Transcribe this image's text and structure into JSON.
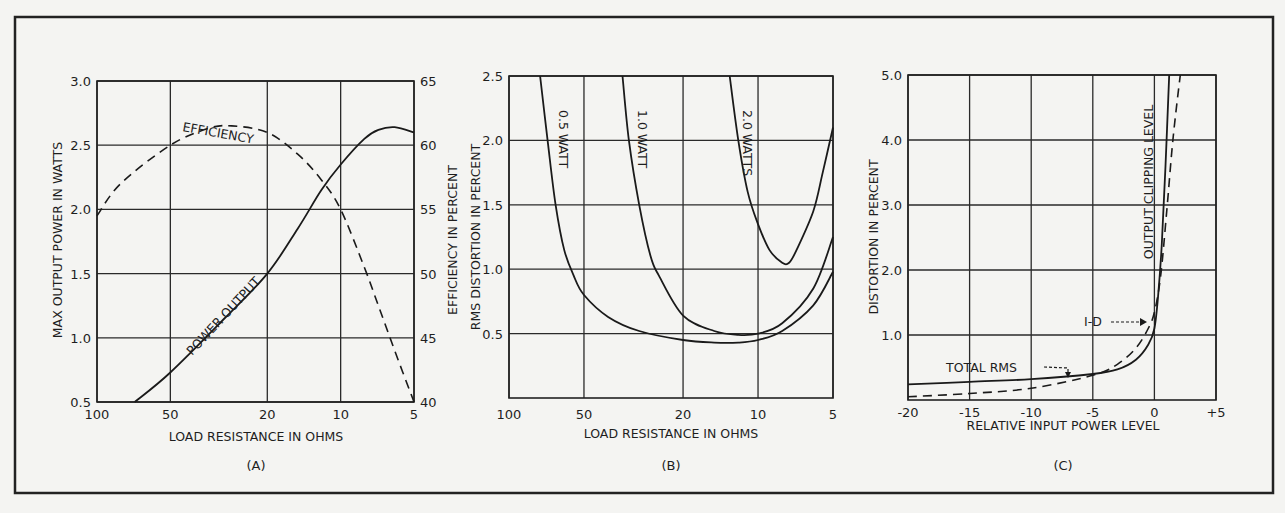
{
  "chart_data": [
    {
      "type": "line",
      "panel_label": "(A)",
      "xlabel": "LOAD RESISTANCE IN OHMS",
      "ylabel": "MAX OUTPUT POWER IN WATTS",
      "ylabel_right": "EFFICIENCY IN PERCENT",
      "xscale": "log",
      "x_reversed": true,
      "xlim": [
        100,
        5
      ],
      "ylim": [
        0.5,
        3.0
      ],
      "ylim_right": [
        40,
        65
      ],
      "x_ticks": [
        "100",
        "50",
        "20",
        "10",
        "5"
      ],
      "y_ticks": [
        "0.5",
        "1.0",
        "1.5",
        "2.0",
        "2.5",
        "3.0"
      ],
      "y_ticks_right": [
        "40",
        "45",
        "50",
        "55",
        "60",
        "65"
      ],
      "grid": true,
      "series": [
        {
          "name": "POWER OUTPUT",
          "style": "solid",
          "axis": "left",
          "x": [
            70,
            50,
            30,
            20,
            15,
            12,
            10,
            8,
            7,
            6,
            5
          ],
          "y": [
            0.5,
            0.73,
            1.15,
            1.5,
            1.85,
            2.15,
            2.35,
            2.55,
            2.62,
            2.64,
            2.6
          ]
        },
        {
          "name": "EFFICIENCY",
          "style": "dashed",
          "axis": "right",
          "x": [
            100,
            80,
            50,
            35,
            28,
            20,
            15,
            12,
            10,
            8,
            7,
            6,
            5
          ],
          "y": [
            54.5,
            57,
            60,
            61.3,
            61.5,
            61,
            59.3,
            57.3,
            55,
            50.5,
            47.5,
            44,
            40
          ]
        }
      ]
    },
    {
      "type": "line",
      "panel_label": "(B)",
      "xlabel": "LOAD RESISTANCE IN OHMS",
      "ylabel": "RMS DISTORTION IN PERCENT",
      "xscale": "log",
      "x_reversed": true,
      "xlim": [
        100,
        5
      ],
      "ylim": [
        0,
        2.5
      ],
      "x_ticks": [
        "100",
        "50",
        "20",
        "10",
        "5"
      ],
      "y_ticks": [
        "0.5",
        "1.0",
        "1.5",
        "2.0",
        "2.5"
      ],
      "grid": true,
      "series": [
        {
          "name": "0.5 WATT",
          "style": "solid",
          "x": [
            75,
            70,
            65,
            60,
            55,
            50,
            40,
            30,
            20,
            15,
            12,
            10,
            8,
            6,
            5
          ],
          "y": [
            2.5,
            2.0,
            1.5,
            1.15,
            0.95,
            0.8,
            0.63,
            0.52,
            0.45,
            0.43,
            0.43,
            0.45,
            0.52,
            0.72,
            0.98
          ]
        },
        {
          "name": "1.0 WATT",
          "style": "solid",
          "x": [
            35,
            33,
            30,
            27,
            25,
            20,
            15,
            12,
            10,
            8,
            6,
            5
          ],
          "y": [
            2.5,
            2.0,
            1.5,
            1.1,
            0.95,
            0.64,
            0.52,
            0.49,
            0.5,
            0.58,
            0.85,
            1.25
          ]
        },
        {
          "name": "2.0 WATTS",
          "style": "solid",
          "x": [
            13,
            12,
            11,
            10,
            9,
            8,
            7.5,
            7,
            6,
            5.5,
            5
          ],
          "y": [
            2.5,
            2.0,
            1.6,
            1.35,
            1.15,
            1.05,
            1.05,
            1.15,
            1.45,
            1.75,
            2.1
          ]
        }
      ]
    },
    {
      "type": "line",
      "panel_label": "(C)",
      "xlabel": "RELATIVE INPUT POWER LEVEL",
      "ylabel": "DISTORTION IN PERCENT",
      "xlim": [
        -20,
        5
      ],
      "ylim": [
        0,
        5.0
      ],
      "x_ticks": [
        "-20",
        "-15",
        "-10",
        "-5",
        "0",
        "+5"
      ],
      "y_ticks": [
        "1.0",
        "2.0",
        "3.0",
        "4.0",
        "5.0"
      ],
      "grid": true,
      "annotations": [
        "OUTPUT CLIPPING LEVEL",
        "TOTAL RMS",
        "I-D"
      ],
      "series": [
        {
          "name": "TOTAL RMS",
          "style": "solid",
          "x": [
            -20,
            -15,
            -10,
            -5,
            -3,
            -1.5,
            -0.5,
            0,
            0.3,
            0.6,
            0.9,
            1.2
          ],
          "y": [
            0.24,
            0.28,
            0.32,
            0.4,
            0.47,
            0.62,
            0.85,
            1.1,
            1.6,
            2.4,
            3.6,
            5.0
          ]
        },
        {
          "name": "I-D",
          "style": "dashed",
          "x": [
            -20,
            -15,
            -10,
            -5,
            -3,
            -1.5,
            -0.5,
            0,
            0.5,
            1.0,
            1.5,
            2.1
          ],
          "y": [
            0.05,
            0.1,
            0.18,
            0.38,
            0.55,
            0.8,
            1.1,
            1.35,
            1.9,
            2.9,
            4.0,
            5.0
          ]
        }
      ]
    }
  ],
  "panels": {
    "a": {
      "label": "(A)",
      "xlabel": "LOAD RESISTANCE IN OHMS",
      "ylabel": "MAX OUTPUT POWER IN WATTS",
      "ylabel_right": "EFFICIENCY IN PERCENT",
      "curve_power": "POWER OUTPUT",
      "curve_eff": "EFFICIENCY",
      "x_ticks": [
        "100",
        "50",
        "20",
        "10",
        "5"
      ],
      "y_ticks": [
        "0.5",
        "1.0",
        "1.5",
        "2.0",
        "2.5",
        "3.0"
      ],
      "y_ticks_right": [
        "40",
        "45",
        "50",
        "55",
        "60",
        "65"
      ]
    },
    "b": {
      "label": "(B)",
      "xlabel": "LOAD RESISTANCE IN OHMS",
      "ylabel": "RMS DISTORTION IN PERCENT",
      "curve1": "0.5 WATT",
      "curve2": "1.0 WATT",
      "curve3": "2.0 WATTS",
      "x_ticks": [
        "100",
        "50",
        "20",
        "10",
        "5"
      ],
      "y_ticks": [
        "0.5",
        "1.0",
        "1.5",
        "2.0",
        "2.5"
      ]
    },
    "c": {
      "label": "(C)",
      "xlabel": "RELATIVE INPUT POWER LEVEL",
      "ylabel": "DISTORTION IN PERCENT",
      "clip_label": "OUTPUT CLIPPING LEVEL",
      "rms_label": "TOTAL RMS",
      "id_label": "I-D",
      "x_ticks": [
        "-20",
        "-15",
        "-10",
        "-5",
        "0",
        "+5"
      ],
      "y_ticks": [
        "1.0",
        "2.0",
        "3.0",
        "4.0",
        "5.0"
      ]
    }
  }
}
